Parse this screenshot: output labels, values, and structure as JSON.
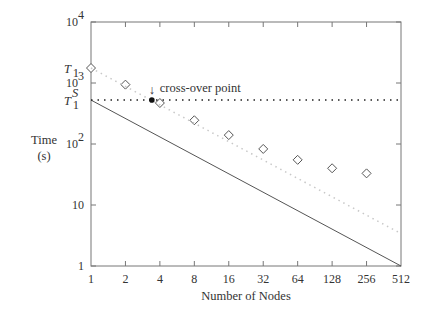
{
  "chart_data": {
    "type": "line",
    "title": "",
    "xlabel": "Number of Nodes",
    "ylabel": "Time (s)",
    "ylabel_lines": [
      "Time",
      "(s)"
    ],
    "xscale": "log2",
    "yscale": "log10",
    "x": [
      1,
      2,
      4,
      8,
      16,
      32,
      64,
      128,
      256,
      512
    ],
    "x_tick_labels": [
      "1",
      "2",
      "4",
      "8",
      "16",
      "32",
      "64",
      "128",
      "256",
      "512"
    ],
    "xlim": [
      1,
      512
    ],
    "ylim": [
      1,
      10000
    ],
    "y_ticks": [
      {
        "value": 1,
        "label": "1"
      },
      {
        "value": 10,
        "label": "10"
      },
      {
        "value": 100,
        "label": "10",
        "sup": "2"
      },
      {
        "value": 1000,
        "label": "10",
        "sup": "3"
      },
      {
        "value": 10000,
        "label": "10",
        "sup": "4"
      }
    ],
    "grid": false,
    "series": [
      {
        "name": "Measured time",
        "style": "diamond-markers",
        "color": "#555555",
        "x": [
          1,
          2,
          4,
          8,
          16,
          32,
          64,
          128,
          256
        ],
        "values": [
          1760,
          940,
          470,
          245,
          140,
          83,
          55,
          40,
          33
        ]
      },
      {
        "name": "Ideal scaling from T1",
        "style": "light-dotted-line",
        "color": "#c8c8c8",
        "x": [
          1,
          512
        ],
        "values": [
          1760,
          3.4
        ]
      },
      {
        "name": "Ideal scaling from T1^S",
        "style": "solid-line",
        "color": "#555555",
        "x": [
          1,
          512
        ],
        "values": [
          525,
          1
        ]
      },
      {
        "name": "Sequential time T1^S",
        "style": "black-dotted-horizontal",
        "color": "#222222",
        "x": [
          1,
          512
        ],
        "values": [
          525,
          525
        ]
      }
    ],
    "annotations": [
      {
        "text": "T",
        "sub": "1",
        "at_y": 1760,
        "position": "left-axis"
      },
      {
        "text": "T",
        "sub": "1",
        "sup": "S",
        "at_y": 525,
        "position": "left-axis"
      },
      {
        "text": "cross-over point",
        "arrow": "↓",
        "at_x": 3.4,
        "at_y": 525
      }
    ]
  }
}
